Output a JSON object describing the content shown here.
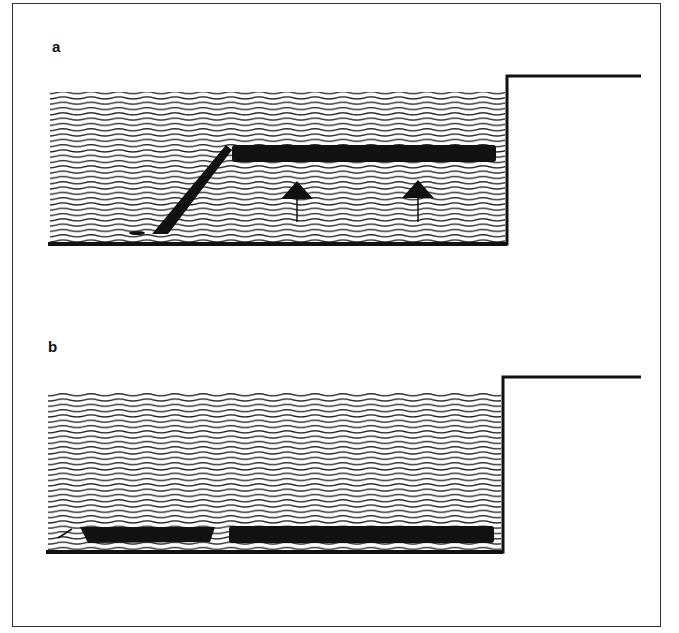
{
  "figure": {
    "panels": [
      {
        "label": "a",
        "description": "Dark layer tilted on left, rising horizontally in water column; arrows indicate upward movement",
        "arrows": 2
      },
      {
        "label": "b",
        "description": "Dark layer settled at the bottom of the water column, split into two segments"
      }
    ],
    "colors": {
      "ink": "#111111",
      "background": "#ffffff"
    }
  }
}
